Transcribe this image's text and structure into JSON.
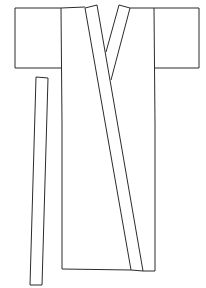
{
  "figure": {
    "stroke_color": "#2b2b2b",
    "background_color": "#ffffff",
    "parts": [
      {
        "name": "left-sleeve"
      },
      {
        "name": "right-sleeve"
      },
      {
        "name": "body"
      },
      {
        "name": "collar-left-strip"
      },
      {
        "name": "collar-right-strip"
      },
      {
        "name": "belt-strip"
      }
    ]
  }
}
